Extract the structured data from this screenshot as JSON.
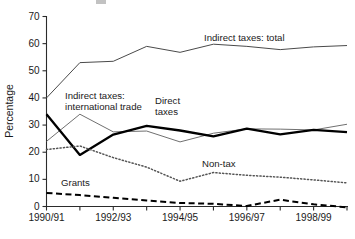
{
  "chart_data": {
    "type": "line",
    "title": "",
    "xlabel": "",
    "ylabel": "Percentage",
    "ylim": [
      0,
      70
    ],
    "yticks": [
      0,
      10,
      20,
      30,
      40,
      50,
      60,
      70
    ],
    "grid": false,
    "legend_position": "inline-annotations",
    "x": [
      "1990/91",
      "1991/92",
      "1992/93",
      "1993/94",
      "1994/95",
      "1995/96",
      "1996/97",
      "1997/98",
      "1998/99",
      "1999/00"
    ],
    "xtick_labels": [
      "1990/91",
      "",
      "1992/93",
      "",
      "1994/95",
      "",
      "1996/97",
      "",
      "1998/99",
      ""
    ],
    "series": [
      {
        "name": "Indirect taxes: total",
        "style": "thin-solid",
        "values": [
          40.0,
          53.0,
          53.5,
          59.0,
          56.8,
          59.8,
          59.0,
          57.8,
          58.8,
          59.3
        ]
      },
      {
        "name": "Indirect taxes: international trade",
        "style": "thin-solid",
        "values": [
          24.0,
          34.0,
          27.5,
          27.8,
          23.8,
          27.0,
          28.6,
          28.5,
          28.2,
          30.3
        ]
      },
      {
        "name": "Direct taxes",
        "style": "bold-solid",
        "values": [
          34.0,
          19.0,
          26.5,
          29.7,
          28.0,
          25.8,
          28.7,
          26.6,
          28.2,
          27.4
        ]
      },
      {
        "name": "Non-tax",
        "style": "dotted",
        "values": [
          21.0,
          22.3,
          18.0,
          14.5,
          9.3,
          12.5,
          11.5,
          10.8,
          9.8,
          8.7
        ]
      },
      {
        "name": "Grants",
        "style": "dashed",
        "values": [
          5.0,
          4.2,
          3.2,
          2.2,
          1.3,
          1.0,
          0.2,
          2.5,
          0.8,
          -0.3
        ]
      }
    ],
    "annotations": [
      {
        "name": "Indirect taxes: total",
        "text": "Indirect taxes: total"
      },
      {
        "name": "Indirect taxes: international trade",
        "line1": "Indirect taxes:",
        "line2": "international trade"
      },
      {
        "name": "Direct taxes",
        "line1": "Direct",
        "line2": "taxes"
      },
      {
        "name": "Non-tax",
        "text": "Non-tax"
      },
      {
        "name": "Grants",
        "text": "Grants"
      }
    ]
  }
}
